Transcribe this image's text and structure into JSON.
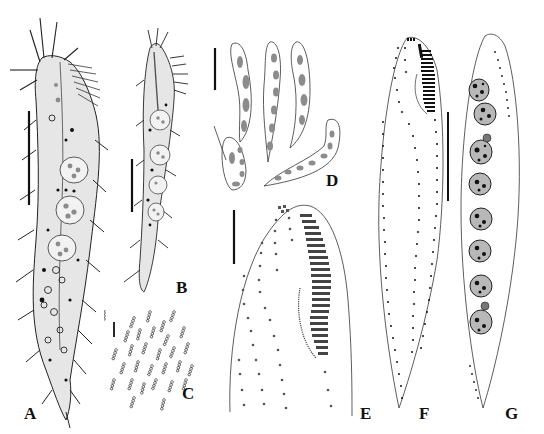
{
  "figure": {
    "panels": [
      {
        "id": "A",
        "label": "A",
        "description": "live specimen, dorsolateral view, with cirri and nuclei"
      },
      {
        "id": "B",
        "label": "B",
        "description": "live specimen, slender contracted form"
      },
      {
        "id": "C",
        "label": "C",
        "description": "cortical granules arranged in short rows"
      },
      {
        "id": "D",
        "label": "D",
        "description": "body shapes, outlines with macronuclear nodules"
      },
      {
        "id": "E",
        "label": "E",
        "description": "anterior ciliature, adoral zone and cirral rows"
      },
      {
        "id": "F",
        "label": "F",
        "description": "ventral ciliature, cirral rows"
      },
      {
        "id": "G",
        "label": "G",
        "description": "dorsal view, macronuclear nodules and micronuclei"
      }
    ],
    "scale_bars": [
      "A",
      "B",
      "C",
      "D",
      "E",
      "F/G"
    ],
    "colors": {
      "ink": "#111111",
      "nucleus_fill": "#8c8c8c",
      "stipple": "#6a6a6a",
      "background": "#ffffff"
    }
  }
}
